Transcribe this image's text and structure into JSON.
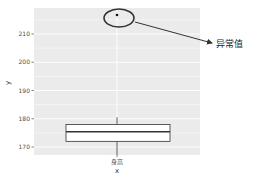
{
  "chart_data": {
    "type": "box",
    "title": "",
    "xlabel": "x",
    "ylabel": "y",
    "categories": [
      "身高"
    ],
    "ylim": [
      167,
      219
    ],
    "yticks": [
      170,
      180,
      190,
      200,
      210
    ],
    "grid": true,
    "legend": null,
    "series": [
      {
        "name": "身高",
        "q1": 172,
        "median": 175.4,
        "q3": 178,
        "whisker_low": 167,
        "whisker_high": 180.5,
        "outliers": [
          216.7
        ]
      }
    ],
    "annotations": [
      {
        "type": "ellipse",
        "target": "outlier",
        "label": "异常值",
        "arrow": true
      }
    ],
    "colors": {
      "panel_bg": "#ebebeb",
      "grid": "#ffffff",
      "box_fill": "#ffffff",
      "box_stroke": "#333333",
      "annotation": "#333333"
    }
  },
  "labels": {
    "x_title": "x",
    "y_title": "y",
    "category": "身高",
    "annotation": "异常值",
    "ticks": [
      "170",
      "180",
      "190",
      "200",
      "210"
    ]
  }
}
